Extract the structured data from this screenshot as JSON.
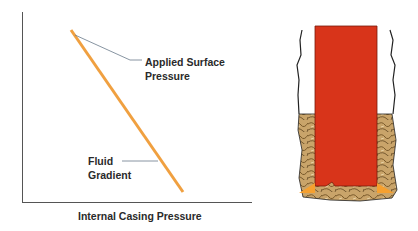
{
  "diagram": {
    "graph": {
      "x_axis_label": "Internal Casing Pressure",
      "annotations": {
        "applied_surface_pressure": [
          "Applied Surface",
          "Pressure"
        ],
        "fluid_gradient": [
          "Fluid",
          "Gradient"
        ]
      },
      "line_color": "#f0a040",
      "axis_color": "#555555"
    },
    "wellbore": {
      "casing_color": "#d8341a",
      "cement_color": "#c9a46a",
      "seal_color": "#f5a030"
    }
  }
}
